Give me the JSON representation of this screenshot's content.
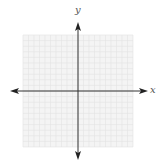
{
  "diagram": {
    "type": "coordinate-plane",
    "x_axis_label": "x",
    "y_axis_label": "y",
    "grid": {
      "columns": 20,
      "rows": 20,
      "color": "#e4e4e4",
      "background": "#f4f4f4"
    },
    "axis_color": "#333333"
  }
}
